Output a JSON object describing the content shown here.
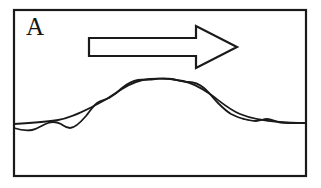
{
  "figure": {
    "panel_label": "A",
    "background_color": "#ffffff",
    "ink_color": "#1a1a1a",
    "frame": {
      "name": "panel-border",
      "x": 14,
      "y": 10,
      "width": 292,
      "height": 166,
      "stroke_width": 2.2
    },
    "arrow": {
      "name": "flow-direction-arrow",
      "direction": "right",
      "style": "outlined",
      "fill": "#ffffff",
      "stroke_width": 2.2,
      "tip_x": 237,
      "tip_y": 47,
      "shaft_left_x": 89,
      "shaft_top_y": 38,
      "shaft_bottom_y": 56,
      "head_top_y": 26,
      "head_bottom_y": 68,
      "head_base_x": 196,
      "points": "89,38 196,38 196,26 237,47 196,68 196,56 89,56"
    },
    "curves": [
      {
        "name": "smooth-profile-curve",
        "role": "smoothed baseline profile",
        "stroke_width": 1.8,
        "path": "M14,124 C30,123 46,122 58,120 C70,118 80,113 92,107 C104,101 112,96 122,89 C131,83 139,80 150,79 C161,78 172,79 183,81 C193,83 200,87 210,94 C220,101 228,109 240,114 C252,119 266,121 280,122 C290,123 298,123 306,123"
      },
      {
        "name": "wavy-profile-curve",
        "role": "raw oscillating profile",
        "stroke_width": 1.8,
        "path": "M14,128 C20,130 26,131 32,130 C38,129 42,125 48,123 C53,121 57,122 61,124 C64,126 66,128 70,128 C75,128 80,123 86,116 C90,111 93,106 97,103 C101,100 105,100 109,98 C114,95 118,92 122,88 C127,84 132,81 138,80 C144,79 149,80 155,79 C161,78 166,78 172,79 C178,80 183,82 189,82 C194,82 199,84 204,88 C209,92 213,98 218,103 C222,107 226,111 231,114 C235,116 239,118 244,119 C248,120 252,121 256,121 C260,121 263,119 267,119 C271,119 274,121 278,122 C283,123 289,123 295,123 C299,123 303,123 306,123"
      }
    ]
  }
}
